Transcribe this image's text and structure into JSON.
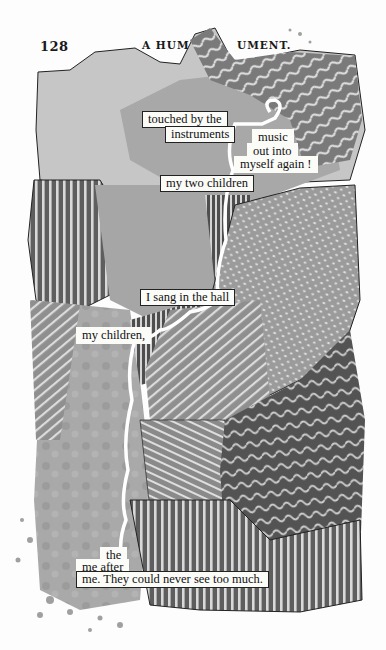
{
  "header": {
    "page_number": "128",
    "title_left": "A HUM",
    "title_right": "UMENT."
  },
  "palette": {
    "paper": "#fdfdfd",
    "light_gray": "#c9c9c9",
    "mid_gray": "#a8a8a8",
    "dark_gray": "#6a6a6a",
    "darker_gray": "#4f4f4f",
    "stripe_light": "#d8d8d8",
    "text": "#111111"
  },
  "text_fragments": [
    {
      "id": "f1",
      "text": "touched by the"
    },
    {
      "id": "f2",
      "text": "instruments"
    },
    {
      "id": "f3",
      "text": "music"
    },
    {
      "id": "f4",
      "text": "out into"
    },
    {
      "id": "f5",
      "text": "myself again !"
    },
    {
      "id": "f6",
      "text": "my two children"
    },
    {
      "id": "f7",
      "text": "I sang in the hall"
    },
    {
      "id": "f8",
      "text": "my children,"
    },
    {
      "id": "f9",
      "text": "the"
    },
    {
      "id": "f10",
      "text": "me after"
    },
    {
      "id": "f11",
      "text": "me.  They could never see too much."
    }
  ]
}
